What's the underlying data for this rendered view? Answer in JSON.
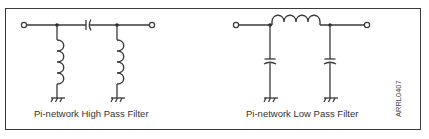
{
  "diagram": {
    "figure_id": "ARRL0407",
    "colors": {
      "line": "#3a3a3a",
      "background": "#ffffff",
      "text": "#333333"
    },
    "circuits": [
      {
        "title": "Pi-network High Pass Filter",
        "type": "high-pass",
        "series_element": "capacitor",
        "shunt_elements": [
          "inductor",
          "inductor"
        ],
        "ground_count": 2
      },
      {
        "title": "Pi-network Low Pass Filter",
        "type": "low-pass",
        "series_element": "inductor",
        "shunt_elements": [
          "capacitor",
          "capacitor"
        ],
        "ground_count": 2
      }
    ]
  }
}
